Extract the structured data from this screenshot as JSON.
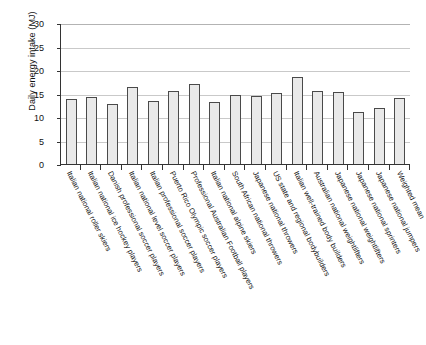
{
  "chart_data": {
    "type": "bar",
    "title": "",
    "subtitle": "",
    "xlabel": "",
    "ylabel": "Daily energy intake (MJ)",
    "ylim": [
      0,
      30
    ],
    "yticks": [
      0,
      5,
      10,
      15,
      20,
      25,
      30
    ],
    "grid": true,
    "legend": false,
    "bar_fill_color": "#e9e9e9",
    "bar_border_color": "#4a4a4a",
    "gridline_color": "#c9c9c9",
    "axis_color": "#333333",
    "categories": [
      "Italian national roller skiers",
      "Italian national ice hockey players",
      "Danish professional soccer players",
      "Italian national level soccer players",
      "Italian professional soccer players",
      "Puerto Rico Olympic soccer players",
      "Professional Australian Football players",
      "Italian national alpine skiers",
      "South African national throwers",
      "Japanese national throwers",
      "US state and regional bodybuilders",
      "Italian well-trained body builders",
      "Australian national weightlifters",
      "Japanese national weightlifters",
      "Japanese national sprinters",
      "Japanese national jumpers",
      "Weighted mean"
    ],
    "values": [
      13.8,
      14.2,
      12.7,
      16.3,
      13.4,
      15.5,
      17.0,
      13.1,
      14.7,
      14.5,
      15.1,
      18.6,
      15.5,
      15.3,
      11.0,
      11.9,
      14.0
    ]
  }
}
